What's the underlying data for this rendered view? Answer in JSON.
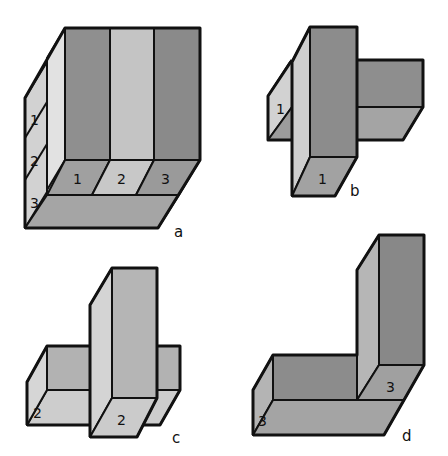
{
  "figures": {
    "a": {
      "caption": "a",
      "side_labels": [
        "1",
        "2",
        "3"
      ],
      "floor_labels": [
        "1",
        "2",
        "3"
      ]
    },
    "b": {
      "caption": "b",
      "side_label": "1",
      "floor_label": "1"
    },
    "c": {
      "caption": "c",
      "side_label": "2",
      "floor_label": "2"
    },
    "d": {
      "caption": "d",
      "side_label": "3",
      "floor_label": "3"
    }
  },
  "colors": {
    "dark": "#8c8c8c",
    "medium": "#a3a3a3",
    "light": "#c6c6c6",
    "lightest": "#dedede",
    "outline": "#111111"
  }
}
